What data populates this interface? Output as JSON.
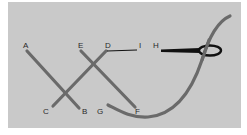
{
  "diagram": {
    "title": "",
    "colors": {
      "background": "#ffffff",
      "panel": "#c9c9c9",
      "strand": "#6a6a6a",
      "needle": "#111111",
      "label": "#2a2a2a"
    },
    "labels": {
      "A": "A",
      "B": "B",
      "C": "C",
      "D": "D",
      "E": "E",
      "F": "F",
      "G": "G",
      "H": "H",
      "I": "I"
    },
    "strands": [
      {
        "name": "A-B",
        "from": "A",
        "to": "B"
      },
      {
        "name": "C-D",
        "from": "C",
        "to": "D"
      },
      {
        "name": "E-F",
        "from": "E",
        "to": "F"
      },
      {
        "name": "G-curve",
        "from": "G",
        "to": "top-right"
      }
    ],
    "needle": {
      "from": "H",
      "eye": "right",
      "tail": "D-I"
    }
  }
}
